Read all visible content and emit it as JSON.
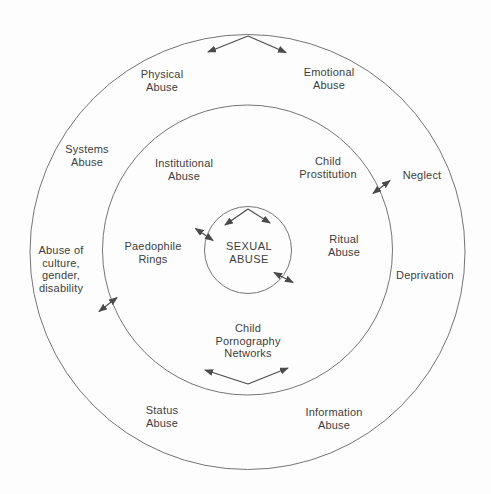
{
  "colors": {
    "background": "#fdfdfd",
    "circle_line": "#757575",
    "arrow_line": "#4a4a4a",
    "text": "#3d3d3d"
  },
  "diagram": {
    "type": "concentric-circles",
    "center": {
      "label": "SEXUAL\nABUSE"
    },
    "middle_ring": {
      "institutional_abuse": "Institutional\nAbuse",
      "child_prostitution": "Child\nProstitution",
      "ritual_abuse": "Ritual\nAbuse",
      "paedophile_rings": "Paedophile\nRings",
      "child_pornography_networks": "Child\nPornography\nNetworks"
    },
    "outer_ring": {
      "physical_abuse": "Physical\nAbuse",
      "emotional_abuse": "Emotional\nAbuse",
      "systems_abuse": "Systems\nAbuse",
      "neglect": "Neglect",
      "abuse_of_culture_gender_disability": "Abuse of\nculture,\ngender,\ndisability",
      "deprivation": "Deprivation",
      "status_abuse": "Status\nAbuse",
      "information_abuse": "Information\nAbuse"
    }
  }
}
